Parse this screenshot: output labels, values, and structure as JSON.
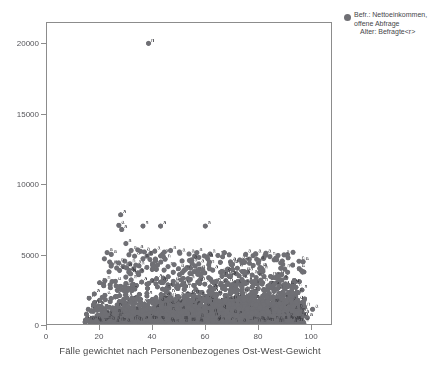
{
  "chart_data": {
    "type": "scatter",
    "title": "",
    "xlabel": "Fälle gewichtet nach Personenbezogenes Ost-West-Gewicht",
    "ylabel": "",
    "xlim": [
      0,
      108
    ],
    "ylim": [
      0,
      21500
    ],
    "xticks": [
      0,
      20,
      40,
      60,
      80,
      100
    ],
    "yticks": [
      0,
      5000,
      10000,
      15000,
      20000
    ],
    "xticklabels": [
      "0",
      "20",
      "40",
      "60",
      "80",
      "100"
    ],
    "yticklabels": [
      "0",
      "5000",
      "10000",
      "15000",
      "20000"
    ],
    "grid": false,
    "marker_color": "#6f6f74",
    "marker_label_color": "#3f3f44",
    "frame_color": "#8c8c8c",
    "point_labels": [
      "a",
      "n"
    ],
    "legend": {
      "position": "top-right-outside",
      "marker_color": "#6f6f74",
      "lines": [
        "Befr.: Nettoeinkommen,",
        "offene Abfrage",
        "Alter: Befragte<r>"
      ]
    },
    "series": [
      {
        "name": "Befr.: Nettoeinkommen, offene Abfrage / Alter: Befragte<r>",
        "points": [
          [
            38.6,
            20050,
            "n"
          ],
          [
            28.0,
            7800,
            "a"
          ],
          [
            27.3,
            7050,
            "a"
          ],
          [
            28.4,
            6750,
            "a"
          ],
          [
            36.5,
            7000,
            "a"
          ],
          [
            43.2,
            7000,
            "a"
          ],
          [
            60.2,
            7000,
            "a"
          ],
          [
            30.0,
            5750,
            "a"
          ],
          [
            32.0,
            5250,
            "a"
          ],
          [
            34.5,
            5300,
            "a"
          ],
          [
            37.0,
            5150,
            "a"
          ],
          [
            39.5,
            5050,
            "a"
          ],
          [
            41.0,
            5200,
            "a"
          ],
          [
            44.0,
            5000,
            "a"
          ],
          [
            47.0,
            5250,
            "a"
          ],
          [
            50.5,
            5050,
            "a"
          ],
          [
            54.0,
            5000,
            "a"
          ],
          [
            57.0,
            5100,
            "a"
          ],
          [
            62.0,
            5000,
            "a"
          ],
          [
            65.0,
            4900,
            "n"
          ],
          [
            24.5,
            4250,
            "a"
          ],
          [
            26.5,
            4000,
            "a"
          ],
          [
            29.0,
            4100,
            "a"
          ],
          [
            31.5,
            4300,
            "n"
          ],
          [
            33.0,
            3950,
            "a"
          ],
          [
            35.0,
            4150,
            "a"
          ],
          [
            36.0,
            3800,
            "a"
          ],
          [
            38.0,
            4050,
            "a"
          ],
          [
            40.0,
            3900,
            "a"
          ],
          [
            42.0,
            4200,
            "a"
          ],
          [
            44.5,
            3850,
            "a"
          ],
          [
            46.0,
            4100,
            "n"
          ],
          [
            48.0,
            3700,
            "a"
          ],
          [
            50.0,
            3950,
            "a"
          ],
          [
            52.0,
            3800,
            "a"
          ],
          [
            54.5,
            4000,
            "a"
          ],
          [
            56.0,
            3750,
            "a"
          ],
          [
            58.0,
            3900,
            "a"
          ],
          [
            60.0,
            3650,
            "n"
          ],
          [
            63.0,
            3850,
            "a"
          ],
          [
            66.0,
            3700,
            "a"
          ],
          [
            69.0,
            3900,
            "a"
          ],
          [
            72.0,
            3600,
            "a"
          ],
          [
            75.0,
            3750,
            "a"
          ],
          [
            78.0,
            3500,
            "a"
          ],
          [
            81.0,
            3650,
            "a"
          ],
          [
            85.0,
            3400,
            "n"
          ],
          [
            88.0,
            3550,
            "a"
          ],
          [
            20.0,
            2950,
            "a"
          ],
          [
            22.0,
            3100,
            "n"
          ],
          [
            24.0,
            2800,
            "a"
          ],
          [
            26.0,
            3050,
            "a"
          ],
          [
            28.0,
            2700,
            "a"
          ],
          [
            30.0,
            2900,
            "a"
          ],
          [
            32.0,
            3150,
            "a"
          ],
          [
            34.0,
            2750,
            "n"
          ],
          [
            36.0,
            3000,
            "a"
          ],
          [
            38.0,
            2850,
            "a"
          ],
          [
            40.0,
            3100,
            "a"
          ],
          [
            42.0,
            2650,
            "a"
          ],
          [
            44.0,
            2950,
            "a"
          ],
          [
            46.0,
            2800,
            "n"
          ],
          [
            48.0,
            3050,
            "a"
          ],
          [
            50.0,
            2700,
            "a"
          ],
          [
            52.0,
            2900,
            "a"
          ],
          [
            54.0,
            3150,
            "a"
          ],
          [
            56.0,
            2750,
            "a"
          ],
          [
            58.0,
            3000,
            "n"
          ],
          [
            60.0,
            2850,
            "a"
          ],
          [
            62.0,
            2650,
            "a"
          ],
          [
            64.0,
            2950,
            "a"
          ],
          [
            66.0,
            2800,
            "a"
          ],
          [
            68.0,
            3100,
            "a"
          ],
          [
            70.0,
            2700,
            "n"
          ],
          [
            72.0,
            2900,
            "a"
          ],
          [
            74.0,
            2750,
            "a"
          ],
          [
            76.0,
            3000,
            "a"
          ],
          [
            78.0,
            2650,
            "a"
          ],
          [
            80.0,
            2850,
            "a"
          ],
          [
            82.0,
            2950,
            "n"
          ],
          [
            84.0,
            2700,
            "a"
          ],
          [
            86.0,
            2800,
            "a"
          ],
          [
            88.0,
            2600,
            "a"
          ],
          [
            90.0,
            2750,
            "a"
          ],
          [
            16.0,
            1850,
            "n"
          ],
          [
            18.0,
            2150,
            "a"
          ],
          [
            20.0,
            1700,
            "a"
          ],
          [
            22.0,
            2050,
            "a"
          ],
          [
            24.0,
            1600,
            "n"
          ],
          [
            26.0,
            1950,
            "a"
          ],
          [
            28.0,
            1500,
            "a"
          ],
          [
            30.0,
            2100,
            "a"
          ],
          [
            32.0,
            1650,
            "a"
          ],
          [
            34.0,
            1900,
            "n"
          ],
          [
            36.0,
            1450,
            "a"
          ],
          [
            38.0,
            2000,
            "a"
          ],
          [
            40.0,
            1750,
            "a"
          ],
          [
            42.0,
            1550,
            "a"
          ],
          [
            44.0,
            2050,
            "n"
          ],
          [
            46.0,
            1850,
            "a"
          ],
          [
            48.0,
            1400,
            "a"
          ],
          [
            50.0,
            1950,
            "a"
          ],
          [
            52.0,
            1700,
            "a"
          ],
          [
            54.0,
            2100,
            "n"
          ],
          [
            56.0,
            1500,
            "a"
          ],
          [
            58.0,
            1800,
            "a"
          ],
          [
            60.0,
            2000,
            "a"
          ],
          [
            62.0,
            1600,
            "a"
          ],
          [
            64.0,
            1900,
            "n"
          ],
          [
            66.0,
            1450,
            "a"
          ],
          [
            68.0,
            2050,
            "a"
          ],
          [
            70.0,
            1750,
            "a"
          ],
          [
            72.0,
            1550,
            "a"
          ],
          [
            74.0,
            1950,
            "n"
          ],
          [
            76.0,
            1700,
            "a"
          ],
          [
            78.0,
            1850,
            "a"
          ],
          [
            80.0,
            1500,
            "a"
          ],
          [
            82.0,
            2000,
            "a"
          ],
          [
            84.0,
            1650,
            "n"
          ],
          [
            86.0,
            1900,
            "a"
          ],
          [
            88.0,
            1400,
            "a"
          ],
          [
            90.0,
            1750,
            "a"
          ],
          [
            92.0,
            1550,
            "a"
          ],
          [
            15.0,
            700,
            "n"
          ],
          [
            17.0,
            950,
            "a"
          ],
          [
            19.0,
            600,
            "a"
          ],
          [
            21.0,
            1100,
            "n"
          ],
          [
            23.0,
            750,
            "a"
          ],
          [
            25.0,
            500,
            "a"
          ],
          [
            27.0,
            1050,
            "a"
          ],
          [
            29.0,
            850,
            "n"
          ],
          [
            31.0,
            650,
            "a"
          ],
          [
            33.0,
            1150,
            "a"
          ],
          [
            35.0,
            450,
            "a"
          ],
          [
            37.0,
            900,
            "n"
          ],
          [
            39.0,
            700,
            "a"
          ],
          [
            41.0,
            1200,
            "a"
          ],
          [
            43.0,
            550,
            "a"
          ],
          [
            45.0,
            1000,
            "n"
          ],
          [
            47.0,
            800,
            "a"
          ],
          [
            49.0,
            400,
            "a"
          ],
          [
            51.0,
            1100,
            "a"
          ],
          [
            53.0,
            650,
            "n"
          ],
          [
            55.0,
            950,
            "a"
          ],
          [
            57.0,
            500,
            "a"
          ],
          [
            59.0,
            1150,
            "a"
          ],
          [
            61.0,
            750,
            "n"
          ],
          [
            63.0,
            600,
            "a"
          ],
          [
            65.0,
            1050,
            "a"
          ],
          [
            67.0,
            850,
            "a"
          ],
          [
            69.0,
            450,
            "n"
          ],
          [
            71.0,
            1200,
            "a"
          ],
          [
            73.0,
            700,
            "a"
          ],
          [
            75.0,
            900,
            "a"
          ],
          [
            77.0,
            550,
            "a"
          ],
          [
            79.0,
            1100,
            "n"
          ],
          [
            81.0,
            800,
            "a"
          ],
          [
            83.0,
            650,
            "a"
          ],
          [
            85.0,
            1000,
            "a"
          ],
          [
            87.0,
            500,
            "n"
          ],
          [
            89.0,
            950,
            "a"
          ],
          [
            91.0,
            700,
            "a"
          ],
          [
            93.0,
            1150,
            "a"
          ],
          [
            95.0,
            600,
            "a"
          ],
          [
            97.0,
            850,
            "n"
          ],
          [
            99.0,
            450,
            "a"
          ],
          [
            101.0,
            1050,
            "a"
          ]
        ]
      }
    ]
  }
}
